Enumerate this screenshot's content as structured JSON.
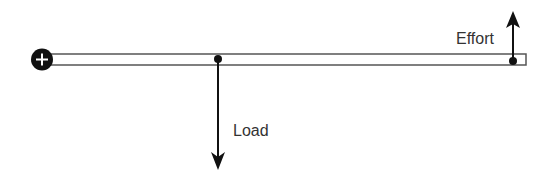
{
  "diagram": {
    "type": "lever",
    "labels": {
      "effort": "Effort",
      "load": "Load"
    },
    "fulcrum": {
      "icon": "plus-icon",
      "position": "left end"
    },
    "colors": {
      "stroke": "#111111",
      "text": "#333333",
      "bar_fill": "#ffffff"
    }
  }
}
